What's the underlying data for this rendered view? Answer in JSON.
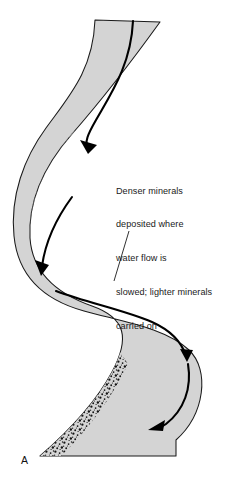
{
  "figure": {
    "panel_label": "A",
    "annotation": {
      "lines": [
        "Denser minerals",
        "deposited where",
        "water flow is",
        "slowed; lighter minerals",
        "carried on"
      ],
      "full_text": "Denser minerals deposited where water flow is slowed; lighter minerals carried on"
    },
    "colors": {
      "channel_fill": "#d4d4d4",
      "channel_outline": "#1a1a1a",
      "flow_line": "#000000",
      "stipple": "#141414",
      "text": "#1a1a1a",
      "background": "#ffffff"
    },
    "elements": {
      "channel_name": "meandering-river-channel",
      "flow_line_name": "thalweg-flow-line",
      "deposit_name": "point-bar-mineral-deposit",
      "leader_name": "annotation-leader-line"
    },
    "deposit_count": 3,
    "flow_arrow_count": 4
  }
}
